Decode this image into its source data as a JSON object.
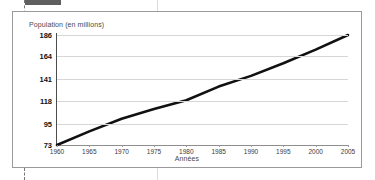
{
  "document": {
    "selection_tab": "",
    "guides_visible": true
  },
  "figure": {
    "ytitle": "Population (en millions)",
    "xtitle": "Années"
  },
  "colors": {
    "line": "#111111",
    "grid": "#d6d6d6",
    "axis": "#4d4d4d",
    "frame": "#9a9a9a",
    "guide": "#dcdcdc",
    "tab": "#5f5f5f",
    "tick_text": "#3a3a3a",
    "label_text": "#4a4a4a"
  },
  "chart_data": {
    "type": "line",
    "title": "",
    "xlabel": "Années",
    "ylabel": "Population (en millions)",
    "x": [
      1960,
      1965,
      1970,
      1975,
      1980,
      1985,
      1990,
      1995,
      2000,
      2005
    ],
    "series": [
      {
        "name": "Population",
        "values": [
          73,
          87,
          100,
          110,
          119,
          133,
          144,
          157,
          171,
          186
        ]
      }
    ],
    "xlim": [
      1960,
      2005
    ],
    "ylim": [
      73,
      186
    ],
    "yticks": [
      73,
      95,
      118,
      141,
      164,
      186
    ],
    "ytick_labels": [
      "73",
      "95",
      "118",
      "141",
      "164",
      "186"
    ],
    "xticks": [
      1960,
      1965,
      1970,
      1975,
      1980,
      1985,
      1990,
      1995,
      2000,
      2005
    ],
    "xtick_labels": [
      "1960",
      "1965",
      "1970",
      "1975",
      "1980",
      "1985",
      "1990",
      "1995",
      "2000",
      "2005"
    ],
    "grid": "horizontal",
    "legend": "none"
  }
}
